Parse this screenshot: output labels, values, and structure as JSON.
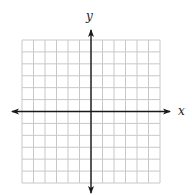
{
  "diagram": {
    "type": "coordinate-plane",
    "x_axis_label": "x",
    "y_axis_label": "y",
    "x_range": [
      -6,
      6
    ],
    "y_range": [
      -6,
      6
    ],
    "grid_step": 1,
    "colors": {
      "grid": "#c8c8c8",
      "axis": "#1a1a1a",
      "background": "#ffffff"
    }
  }
}
